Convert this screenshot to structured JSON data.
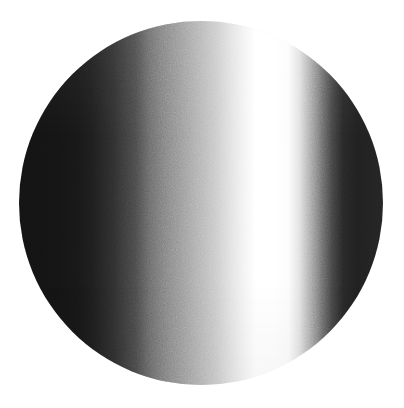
{
  "canvas": {
    "width": 404,
    "height": 408,
    "background_color": "#ffffff"
  },
  "figure": {
    "name": "gradient-disc",
    "shape": "circle",
    "center_x": 201,
    "center_y": 203,
    "radius": 182,
    "bounds": {
      "left": 20,
      "top": 19,
      "right": 383,
      "bottom": 388
    },
    "texture": "film-grain",
    "edge": "soft-antialiased"
  },
  "chart_data": {
    "type": "heatmap",
    "title": "",
    "subtitle": "",
    "xlabel": "",
    "ylabel": "",
    "grid": false,
    "legend": "none",
    "orientation": "horizontal",
    "colorscale": "grayscale",
    "value_range": [
      18,
      255
    ],
    "x": [
      0,
      4,
      10,
      16,
      20,
      26,
      32,
      36,
      42,
      48,
      54,
      58,
      62,
      65,
      70,
      74,
      77,
      80,
      83,
      86,
      89,
      93,
      100
    ],
    "values": [
      18,
      18,
      19,
      22,
      28,
      45,
      72,
      105,
      138,
      170,
      200,
      224,
      244,
      255,
      255,
      252,
      225,
      170,
      112,
      66,
      38,
      30,
      34
    ],
    "stops": [
      {
        "position_pct": 0,
        "gray": 18,
        "hex": "#121212"
      },
      {
        "position_pct": 4,
        "gray": 18,
        "hex": "#121212"
      },
      {
        "position_pct": 10,
        "gray": 19,
        "hex": "#131313"
      },
      {
        "position_pct": 16,
        "gray": 22,
        "hex": "#161616"
      },
      {
        "position_pct": 20,
        "gray": 28,
        "hex": "#1c1c1c"
      },
      {
        "position_pct": 26,
        "gray": 45,
        "hex": "#2d2d2d"
      },
      {
        "position_pct": 32,
        "gray": 72,
        "hex": "#484848"
      },
      {
        "position_pct": 36,
        "gray": 105,
        "hex": "#696969"
      },
      {
        "position_pct": 42,
        "gray": 138,
        "hex": "#8a8a8a"
      },
      {
        "position_pct": 48,
        "gray": 170,
        "hex": "#aaaaaa"
      },
      {
        "position_pct": 54,
        "gray": 200,
        "hex": "#c8c8c8"
      },
      {
        "position_pct": 58,
        "gray": 224,
        "hex": "#e0e0e0"
      },
      {
        "position_pct": 62,
        "gray": 244,
        "hex": "#f4f4f4"
      },
      {
        "position_pct": 65,
        "gray": 255,
        "hex": "#ffffff"
      },
      {
        "position_pct": 70,
        "gray": 255,
        "hex": "#ffffff"
      },
      {
        "position_pct": 74,
        "gray": 252,
        "hex": "#fcfcfc"
      },
      {
        "position_pct": 77,
        "gray": 225,
        "hex": "#e1e1e1"
      },
      {
        "position_pct": 80,
        "gray": 170,
        "hex": "#aaaaaa"
      },
      {
        "position_pct": 83,
        "gray": 112,
        "hex": "#707070"
      },
      {
        "position_pct": 86,
        "gray": 66,
        "hex": "#424242"
      },
      {
        "position_pct": 89,
        "gray": 38,
        "hex": "#262626"
      },
      {
        "position_pct": 93,
        "gray": 30,
        "hex": "#1e1e1e"
      },
      {
        "position_pct": 100,
        "gray": 34,
        "hex": "#222222"
      }
    ],
    "features": [
      {
        "name": "left-dark-plateau",
        "from_pct": 0,
        "to_pct": 18,
        "gray": 18
      },
      {
        "name": "rising-ramp",
        "from_pct": 18,
        "to_pct": 65,
        "gray_from": 22,
        "gray_to": 255
      },
      {
        "name": "white-band",
        "from_pct": 62,
        "to_pct": 75,
        "gray": 255
      },
      {
        "name": "steep-falloff",
        "from_pct": 75,
        "to_pct": 89,
        "gray_from": 252,
        "gray_to": 38
      },
      {
        "name": "right-dark-plateau",
        "from_pct": 89,
        "to_pct": 100,
        "gray": 32
      }
    ]
  }
}
